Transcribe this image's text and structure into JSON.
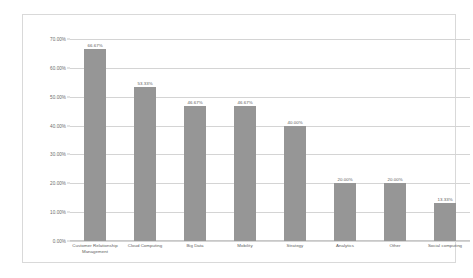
{
  "chart_data": {
    "type": "bar",
    "title": "",
    "subtitle": "",
    "xlabel": "",
    "ylabel": "",
    "ylim": [
      0,
      70
    ],
    "y_tick_labels": [
      "70.00%",
      "60.00%",
      "50.00%",
      "40.00%",
      "30.00%",
      "20.00%",
      "10.00%",
      "0.00%"
    ],
    "y_tick_values": [
      70,
      60,
      50,
      40,
      30,
      20,
      10,
      0
    ],
    "grid": true,
    "legend": false,
    "legend_position": "none",
    "value_suffix": "%",
    "categories": [
      "Customer Relationship Management",
      "Cloud Computing",
      "Big Data",
      "Mobility",
      "Strategy",
      "Analytics",
      "Other",
      "Social computing"
    ],
    "values": [
      66.67,
      53.33,
      46.67,
      46.67,
      40.0,
      20.0,
      20.0,
      13.33
    ],
    "data_labels": [
      "66.67%",
      "53.33%",
      "46.67%",
      "46.67%",
      "40.00%",
      "20.00%",
      "20.00%",
      "13.33%"
    ],
    "colors": {
      "bar": "#969696",
      "gridline": "#d4d4d4",
      "frame": "#d9d9d9",
      "axis_text": "#6b6b6b",
      "label_text": "#5e5e5e",
      "background": "#ffffff"
    }
  }
}
